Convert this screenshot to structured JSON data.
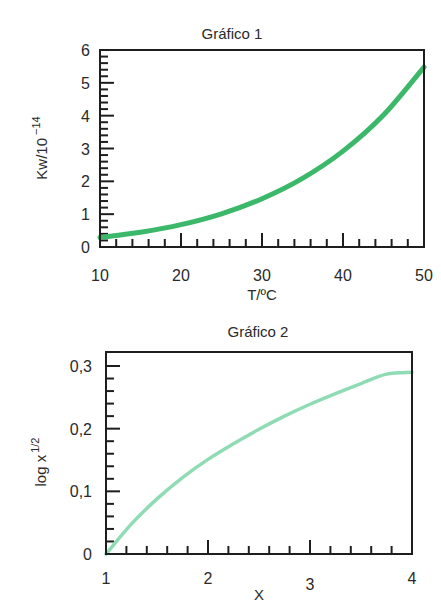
{
  "chart_data": [
    {
      "type": "line",
      "title": "Gráfico 1",
      "xlabel": "T/ºC",
      "ylabel": "Kw/10",
      "ylabel_superscript": "−14",
      "xlim": [
        10,
        50
      ],
      "ylim": [
        0,
        6
      ],
      "x_ticks": [
        10,
        20,
        30,
        40,
        50
      ],
      "x_tick_labels": [
        "10",
        "20",
        "30",
        "40",
        "50"
      ],
      "x_minor_step": 2,
      "y_ticks": [
        0,
        1,
        2,
        3,
        4,
        5,
        6
      ],
      "y_tick_labels": [
        "0",
        "1",
        "2",
        "3",
        "4",
        "5",
        "6"
      ],
      "y_minor_step": 0.2,
      "grid": false,
      "legend": null,
      "line_color": "#3cb86a",
      "series": [
        {
          "name": "Kw",
          "x": [
            10,
            15,
            20,
            25,
            30,
            35,
            40,
            45,
            50
          ],
          "values": [
            0.29,
            0.45,
            0.68,
            1.01,
            1.47,
            2.09,
            2.92,
            4.02,
            5.48
          ]
        }
      ]
    },
    {
      "type": "line",
      "title": "Gráfico 2",
      "xlabel": "X",
      "ylabel": "log x",
      "ylabel_superscript": "1/2",
      "xlim": [
        1,
        4
      ],
      "ylim": [
        0,
        0.32
      ],
      "x_ticks": [
        1,
        2,
        3,
        4
      ],
      "x_tick_labels": [
        "1",
        "2",
        "3",
        "4"
      ],
      "x_minor_step": 0.2,
      "y_ticks": [
        0,
        0.1,
        0.2,
        0.3
      ],
      "y_tick_labels": [
        "0",
        "0,1",
        "0,2",
        "0,3"
      ],
      "y_minor_step": 0.02,
      "grid": false,
      "legend": null,
      "line_color": "#8fdcb4",
      "series": [
        {
          "name": "log x^1/2",
          "x": [
            1,
            1.25,
            1.5,
            1.75,
            2,
            2.25,
            2.5,
            2.75,
            3,
            3.25,
            3.5,
            3.75,
            4
          ],
          "values": [
            0,
            0.048,
            0.088,
            0.122,
            0.151,
            0.176,
            0.199,
            0.22,
            0.239,
            0.256,
            0.272,
            0.287,
            0.29
          ]
        }
      ]
    }
  ]
}
